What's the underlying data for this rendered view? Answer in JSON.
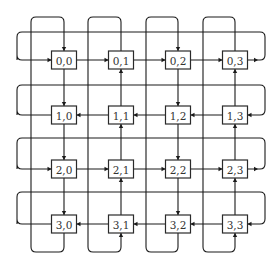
{
  "diagram": {
    "type": "2D torus network (4x4) with unidirectional links",
    "rows": 4,
    "cols": 4,
    "colors": {
      "line": "#1a1a1a",
      "box_border": "#2a2a2a",
      "text": "#333333",
      "background": "#ffffff"
    },
    "nodes": [
      [
        "0,0",
        "0,1",
        "0,2",
        "0,3"
      ],
      [
        "1,0",
        "1,1",
        "1,2",
        "1,3"
      ],
      [
        "2,0",
        "2,1",
        "2,2",
        "2,3"
      ],
      [
        "3,0",
        "3,1",
        "3,2",
        "3,3"
      ]
    ],
    "row_directions": [
      "right",
      "left",
      "right",
      "left"
    ],
    "col_directions": [
      "down",
      "up",
      "down",
      "up"
    ],
    "geometry": {
      "col_centers": [
        64,
        121,
        178,
        235
      ],
      "col_return_x": [
        31,
        88,
        146,
        203
      ],
      "row_centers": [
        60,
        115,
        169,
        224
      ],
      "row_return_y": [
        32,
        85,
        138,
        192
      ],
      "left_x": 17,
      "right_x": 265,
      "top_y": 17,
      "bottom_y": 252,
      "box_w": 25,
      "box_h": 18
    }
  }
}
